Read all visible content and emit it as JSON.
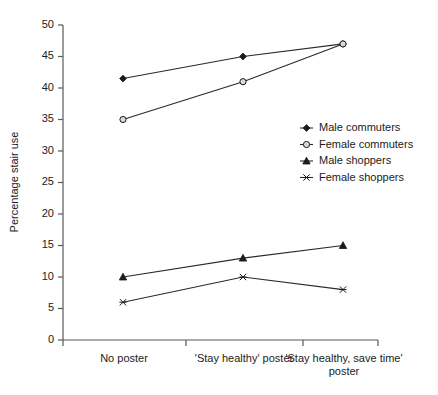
{
  "chart_data": {
    "type": "line",
    "title": "",
    "xlabel": "",
    "ylabel": "Percentage stair use",
    "ylim": [
      0,
      50
    ],
    "yticks": [
      0,
      5,
      10,
      15,
      20,
      25,
      30,
      35,
      40,
      45,
      50
    ],
    "grid": false,
    "legend_position": "center-right",
    "categories": [
      "No poster",
      "'Stay healthy' poster",
      "'Stay healthy, save time' poster"
    ],
    "series": [
      {
        "name": "Male commuters",
        "marker": "filled-diamond",
        "values": [
          41.5,
          45,
          47
        ]
      },
      {
        "name": "Female commuters",
        "marker": "open-circle",
        "values": [
          35,
          41,
          47
        ]
      },
      {
        "name": "Male shoppers",
        "marker": "filled-triangle",
        "values": [
          10,
          13,
          15
        ]
      },
      {
        "name": "Female shoppers",
        "marker": "asterisk",
        "values": [
          6,
          10,
          8
        ]
      }
    ]
  },
  "axis": {
    "y_title": "Percentage stair use",
    "y_tick_labels": [
      "0",
      "5",
      "10",
      "15",
      "20",
      "25",
      "30",
      "35",
      "40",
      "45",
      "50"
    ],
    "x_tick_labels": [
      "No poster",
      "'Stay healthy' poster",
      "'Stay healthy, save time'",
      "poster"
    ]
  },
  "legend": {
    "items": [
      {
        "label": "Male commuters"
      },
      {
        "label": "Female commuters"
      },
      {
        "label": "Male shoppers"
      },
      {
        "label": "Female shoppers"
      }
    ]
  },
  "colors": {
    "ink": "#1b1b1b",
    "axis": "#555a5c",
    "open_marker_fill": "#d8d8d8",
    "background": "#ffffff"
  }
}
